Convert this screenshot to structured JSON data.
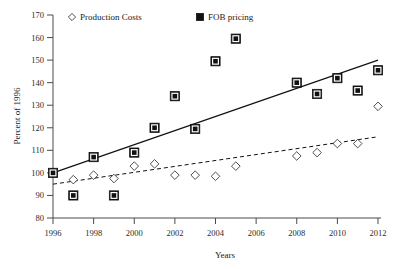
{
  "chart_data": {
    "type": "scatter",
    "title": "",
    "xlabel": "Years",
    "ylabel": "Percent of 1996",
    "xlim": [
      1996,
      2012
    ],
    "ylim": [
      80,
      170
    ],
    "grid": false,
    "legend_position": "top",
    "x_ticks": [
      "1996",
      "1998",
      "2000",
      "2002",
      "2004",
      "2006",
      "2008",
      "2010",
      "2012"
    ],
    "y_ticks": [
      "80",
      "90",
      "100",
      "110",
      "120",
      "130",
      "140",
      "150",
      "160",
      "170"
    ],
    "series": [
      {
        "name": "Production Costs",
        "marker": "open-diamond",
        "color": "#3a3a3a",
        "x": [
          1996,
          1997,
          1998,
          1999,
          2000,
          2001,
          2002,
          2003,
          2004,
          2005,
          2008,
          2009,
          2010,
          2011,
          2012
        ],
        "values": [
          100,
          97,
          99,
          97.5,
          103,
          104,
          99,
          99,
          98.5,
          103,
          107.5,
          109,
          113,
          113,
          129.5
        ],
        "trendline": {
          "style": "dashed",
          "x_start": 1996,
          "y_start": 95,
          "x_end": 2012,
          "y_end": 116
        }
      },
      {
        "name": "FOB pricing",
        "marker": "filled-square",
        "color": "#111111",
        "x": [
          1996,
          1997,
          1998,
          1999,
          2000,
          2001,
          2002,
          2003,
          2004,
          2005,
          2008,
          2009,
          2010,
          2011,
          2012
        ],
        "values": [
          100,
          90,
          107,
          90,
          109,
          120,
          134,
          119.5,
          149.5,
          159.5,
          140,
          135,
          142,
          136.5,
          145.5
        ],
        "trendline": {
          "style": "solid",
          "x_start": 1996,
          "y_start": 100,
          "x_end": 2012,
          "y_end": 150
        }
      }
    ]
  },
  "legend": {
    "items": [
      {
        "label": "Production Costs",
        "marker": "open-diamond"
      },
      {
        "label": "FOB pricing",
        "marker": "filled-square"
      }
    ]
  },
  "axes": {
    "y_axis_title": "Percent of 1996",
    "x_axis_title": "Years"
  }
}
